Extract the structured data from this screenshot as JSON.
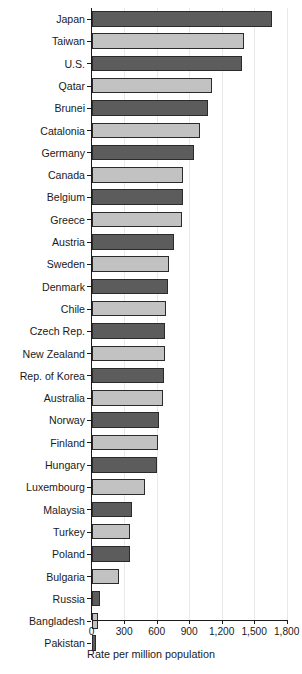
{
  "chart_data": {
    "type": "bar",
    "orientation": "horizontal",
    "title": "",
    "xlabel": "Rate per million population",
    "ylabel": "",
    "xlim": [
      0,
      1800
    ],
    "xticks": [
      0,
      300,
      600,
      900,
      1200,
      1500,
      1800
    ],
    "xtick_labels": [
      "0",
      "300",
      "600",
      "900",
      "1,200",
      "1,500",
      "1,800"
    ],
    "grid": true,
    "legend": "none",
    "colors": {
      "dark_bar": "#5c5c5c",
      "light_bar": "#c2c2c2",
      "bar_outline": "#2b2b2b",
      "gridline": "#e9e9e9",
      "axis": "#1a1a1a",
      "background": "#ffffff"
    },
    "categories": [
      "Japan",
      "Taiwan",
      "U.S.",
      "Qatar",
      "Brunei",
      "Catalonia",
      "Germany",
      "Canada",
      "Belgium",
      "Greece",
      "Austria",
      "Sweden",
      "Denmark",
      "Chile",
      "Czech Rep.",
      "New Zealand",
      "Rep. of Korea",
      "Australia",
      "Norway",
      "Finland",
      "Hungary",
      "Luxembourg",
      "Malaysia",
      "Turkey",
      "Poland",
      "Bulgaria",
      "Russia",
      "Bangladesh",
      "Pakistan"
    ],
    "values": [
      1660,
      1405,
      1390,
      1110,
      1075,
      1000,
      940,
      845,
      840,
      830,
      760,
      715,
      700,
      685,
      680,
      675,
      670,
      660,
      620,
      610,
      600,
      490,
      370,
      355,
      350,
      255,
      75,
      55,
      40
    ],
    "bar_shades": [
      "dark",
      "light",
      "dark",
      "light",
      "dark",
      "light",
      "dark",
      "light",
      "dark",
      "light",
      "dark",
      "light",
      "dark",
      "light",
      "dark",
      "light",
      "dark",
      "light",
      "dark",
      "light",
      "dark",
      "light",
      "dark",
      "light",
      "dark",
      "light",
      "dark",
      "light",
      "dark"
    ]
  }
}
